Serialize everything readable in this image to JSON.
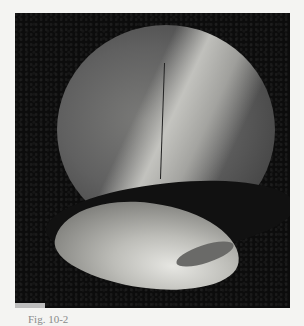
{
  "figure": {
    "type": "grayscale endoscopic photograph",
    "caption": "Fig. 10-2"
  },
  "colors": {
    "page_background": "#f4f4f2",
    "frame_background": "#0c0c0c",
    "caption_text": "#8a8a8a"
  }
}
